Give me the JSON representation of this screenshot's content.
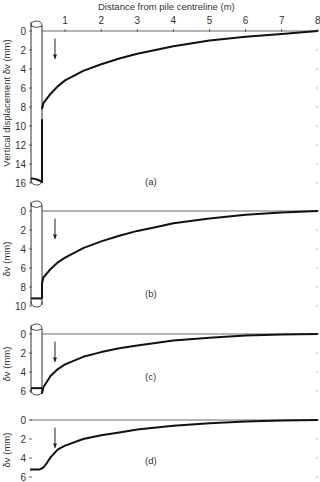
{
  "chart_data": [
    {
      "type": "line",
      "panel_label": "(a)",
      "title": "",
      "xlabel": "Distance from pile centreline (m)",
      "ylabel": "Vertical displacement δv (mm)",
      "xticks": [
        "1",
        "2",
        "3",
        "4",
        "5",
        "6",
        "7",
        "8"
      ],
      "yticks": [
        "0",
        "2",
        "4",
        "6",
        "8",
        "10",
        "12",
        "14",
        "16"
      ],
      "xlim": [
        0,
        8
      ],
      "ylim": [
        16,
        0
      ],
      "y_inverted": true,
      "pile_settlement_mm": 15.5,
      "series": [
        {
          "name": "soil surface displacement",
          "x": [
            0.35,
            0.4,
            0.6,
            0.8,
            1.0,
            1.5,
            2.0,
            2.5,
            3.0,
            3.5,
            4.0,
            5.0,
            6.0,
            7.0,
            8.0
          ],
          "y": [
            8.2,
            7.6,
            6.6,
            5.8,
            5.2,
            4.2,
            3.5,
            2.9,
            2.4,
            2.0,
            1.6,
            1.0,
            0.6,
            0.3,
            0.0
          ]
        }
      ],
      "annotations": [
        "downward arrow near x≈0.7 m"
      ]
    },
    {
      "type": "line",
      "panel_label": "(b)",
      "xlabel": "",
      "ylabel": "δv (mm)",
      "yticks": [
        "0",
        "2",
        "4",
        "6",
        "8",
        "10"
      ],
      "xlim": [
        0,
        8
      ],
      "ylim": [
        10,
        0
      ],
      "y_inverted": true,
      "pile_settlement_mm": 9.2,
      "series": [
        {
          "name": "soil surface displacement",
          "x": [
            0.35,
            0.4,
            0.6,
            0.8,
            1.0,
            1.5,
            2.0,
            2.5,
            3.0,
            3.5,
            4.0,
            5.0,
            6.0,
            7.0,
            8.0
          ],
          "y": [
            7.6,
            7.0,
            6.1,
            5.4,
            4.9,
            3.9,
            3.2,
            2.6,
            2.1,
            1.7,
            1.3,
            0.8,
            0.4,
            0.15,
            0.0
          ]
        }
      ],
      "annotations": [
        "downward arrow near x≈0.7 m"
      ]
    },
    {
      "type": "line",
      "panel_label": "(c)",
      "xlabel": "",
      "ylabel": "δv (mm)",
      "yticks": [
        "0",
        "2",
        "4",
        "6"
      ],
      "xlim": [
        0,
        8
      ],
      "ylim": [
        6.5,
        0
      ],
      "y_inverted": true,
      "pile_settlement_mm": 5.7,
      "series": [
        {
          "name": "soil surface displacement",
          "x": [
            0.3,
            0.35,
            0.4,
            0.6,
            0.8,
            1.0,
            1.5,
            2.0,
            2.5,
            3.0,
            4.0,
            5.0,
            6.0,
            7.0,
            8.0
          ],
          "y": [
            6.1,
            6.2,
            5.6,
            4.4,
            3.7,
            3.2,
            2.4,
            1.9,
            1.5,
            1.2,
            0.7,
            0.4,
            0.15,
            0.05,
            0.0
          ]
        }
      ],
      "annotations": [
        "downward arrow near x≈0.7 m"
      ]
    },
    {
      "type": "line",
      "panel_label": "(d)",
      "xlabel": "",
      "ylabel": "δv (mm)",
      "yticks": [
        "0",
        "2",
        "4",
        "6"
      ],
      "xlim": [
        0,
        8
      ],
      "ylim": [
        6,
        0
      ],
      "y_inverted": true,
      "series": [
        {
          "name": "soil surface displacement",
          "x": [
            0.0,
            0.3,
            0.4,
            0.5,
            0.6,
            0.8,
            1.0,
            1.5,
            2.0,
            2.5,
            3.0,
            4.0,
            5.0,
            6.0,
            7.0,
            8.0
          ],
          "y": [
            5.2,
            5.2,
            5.0,
            4.5,
            3.9,
            3.1,
            2.7,
            2.0,
            1.6,
            1.3,
            1.0,
            0.6,
            0.35,
            0.15,
            0.05,
            0.0
          ]
        }
      ],
      "annotations": [
        "downward arrow near x≈0.7 m"
      ]
    }
  ],
  "labels": {
    "x_axis_title": "Distance from pile centreline (m)",
    "y_axis_title_a": "Vertical displacement δv (mm)",
    "y_axis_title_short": "δv (mm)",
    "panel_a": "(a)",
    "panel_b": "(b)",
    "panel_c": "(c)",
    "panel_d": "(d)"
  }
}
